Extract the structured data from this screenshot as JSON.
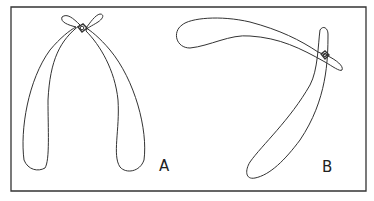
{
  "figure": {
    "panels": [
      {
        "id": "A",
        "label": "A",
        "description": "V-shaped pair of crossed elongated lobes joined at a small knot near the top"
      },
      {
        "id": "B",
        "label": "B",
        "description": "Arched pair of crossed elongated lobes joined at a small knot near the upper right"
      }
    ],
    "colors": {
      "stroke": "#333333",
      "background": "#ffffff"
    }
  }
}
